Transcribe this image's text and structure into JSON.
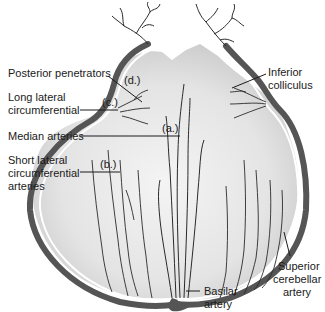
{
  "diagram": {
    "colors": {
      "artery_fill": "#555555",
      "vessel": "#2a2a2a",
      "tissue_light": "#f2f2f2",
      "tissue_mid": "#d9d9d9",
      "tissue_dark": "#c4c4c4",
      "label_text": "#1a1a1a",
      "background": "#ffffff"
    },
    "labels": {
      "posterior_penetrators": "Posterior penetrators",
      "long_lateral_line1": "Long lateral",
      "long_lateral_line2": "circumferential",
      "median_arteries": "Median arteries",
      "short_lateral_line1": "Short lateral",
      "short_lateral_line2": "circumferential",
      "short_lateral_line3": "arteries",
      "inferior_colliculus_line1": "Inferior",
      "inferior_colliculus_line2": "colliculus",
      "superior_cerebellar_line1": "Superior",
      "superior_cerebellar_line2": "cerebellar",
      "superior_cerebellar_line3": "artery",
      "basilar_line1": "Basilar",
      "basilar_line2": "artery"
    },
    "markers": {
      "a": "(a.)",
      "b": "(b.)",
      "c": "(c.)",
      "d": "(d.)"
    }
  }
}
